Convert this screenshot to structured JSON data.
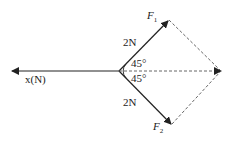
{
  "diagram": {
    "type": "force-vector-diagram",
    "axis_label": "x(N)",
    "forces": [
      {
        "name": "F",
        "subscript": "1",
        "magnitude": "2N",
        "angle": "45°"
      },
      {
        "name": "F",
        "subscript": "2",
        "magnitude": "2N",
        "angle": "45°"
      }
    ],
    "resultant": "dashed parallelogram diagonal",
    "colors": {
      "line": "#222222",
      "dashed": "#555555"
    }
  }
}
